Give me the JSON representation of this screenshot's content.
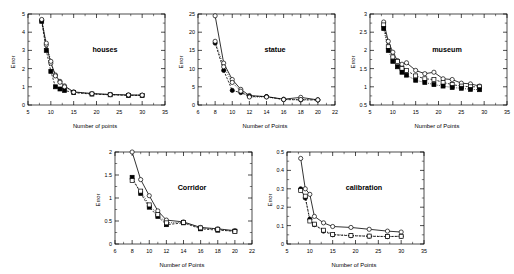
{
  "figure": {
    "background": "#ffffff",
    "panel_count": 5
  },
  "chart_data": [
    {
      "id": "houses",
      "type": "line",
      "title": "houses",
      "xlabel": "Number of points",
      "ylabel": "Error",
      "xlim": [
        5,
        35
      ],
      "ylim": [
        0,
        5
      ],
      "xticks": [
        5,
        10,
        15,
        20,
        25,
        30,
        35
      ],
      "yticks": [
        0,
        1,
        2,
        3,
        4,
        5
      ],
      "grid": false,
      "legend": "none",
      "series": [
        {
          "name": "solid-open-circle",
          "style": "solid",
          "marker": "open-circle",
          "x": [
            8,
            9,
            10,
            11,
            12,
            13,
            15,
            19,
            23,
            27,
            30
          ],
          "y": [
            4.65,
            3.3,
            2.3,
            1.65,
            1.3,
            1.05,
            0.72,
            0.63,
            0.58,
            0.55,
            0.54
          ]
        },
        {
          "name": "dashed-filled-square",
          "style": "dashed",
          "marker": "filled-square",
          "x": [
            8,
            9,
            10,
            11,
            12,
            13,
            15,
            19,
            23,
            27,
            30
          ],
          "y": [
            4.6,
            3.0,
            1.85,
            1.0,
            0.88,
            0.8,
            0.68,
            0.6,
            0.56,
            0.53,
            0.53
          ]
        },
        {
          "name": "dotted-open-circle",
          "style": "dotted",
          "marker": "open-circle",
          "x": [
            8,
            9,
            10,
            11,
            12,
            13,
            15,
            19,
            23,
            27,
            30
          ],
          "y": [
            4.7,
            3.4,
            2.4,
            1.6,
            1.25,
            1.0,
            0.7,
            0.62,
            0.57,
            0.55,
            0.54
          ]
        }
      ]
    },
    {
      "id": "statue",
      "type": "line",
      "title": "statue",
      "xlabel": "Number of Points",
      "ylabel": "Error",
      "xlim": [
        6,
        22
      ],
      "ylim": [
        0,
        25
      ],
      "xticks": [
        6,
        8,
        10,
        12,
        14,
        16,
        18,
        20,
        22
      ],
      "yticks": [
        0,
        5,
        10,
        15,
        20,
        25
      ],
      "grid": false,
      "legend": "none",
      "series": [
        {
          "name": "solid-open-circle",
          "style": "solid",
          "marker": "open-circle",
          "x": [
            8,
            9,
            10,
            11,
            12,
            14,
            16,
            18,
            20
          ],
          "y": [
            24.5,
            11.5,
            7.0,
            4.3,
            2.6,
            2.3,
            1.6,
            2.1,
            1.4
          ]
        },
        {
          "name": "dashed-filled-circle",
          "style": "dashed",
          "marker": "filled-circle",
          "x": [
            8,
            9,
            10,
            11,
            12,
            14,
            16,
            18,
            20
          ],
          "y": [
            17.0,
            9.5,
            4.0,
            3.4,
            2.4,
            2.3,
            1.5,
            1.4,
            1.4
          ]
        },
        {
          "name": "dotted-open-circle",
          "style": "dotted",
          "marker": "open-circle",
          "x": [
            8,
            9,
            10,
            11,
            12,
            14,
            16,
            18,
            20
          ],
          "y": [
            17.5,
            10.5,
            6.2,
            3.8,
            2.2,
            2.2,
            1.5,
            1.5,
            1.4
          ]
        }
      ]
    },
    {
      "id": "museum",
      "type": "line",
      "title": "museum",
      "xlabel": "Number of Points",
      "ylabel": "Error",
      "xlim": [
        5,
        35
      ],
      "ylim": [
        0.5,
        3
      ],
      "xticks": [
        5,
        10,
        15,
        20,
        25,
        30,
        35
      ],
      "yticks": [
        0.5,
        1,
        1.5,
        2,
        2.5,
        3
      ],
      "grid": false,
      "legend": "none",
      "series": [
        {
          "name": "solid-open-circle",
          "style": "solid",
          "marker": "open-circle",
          "x": [
            8,
            9,
            10,
            11,
            12,
            13,
            15,
            17,
            19,
            21,
            23,
            25,
            27,
            29
          ],
          "y": [
            2.78,
            2.25,
            1.95,
            1.72,
            1.62,
            1.66,
            1.45,
            1.36,
            1.4,
            1.22,
            1.2,
            1.1,
            1.08,
            1.02
          ]
        },
        {
          "name": "dashed-open-square",
          "style": "dashed",
          "marker": "open-square",
          "x": [
            8,
            9,
            10,
            11,
            12,
            13,
            15,
            17,
            19,
            21,
            23,
            25,
            27,
            29
          ],
          "y": [
            2.7,
            2.1,
            1.82,
            1.7,
            1.5,
            1.45,
            1.3,
            1.22,
            1.2,
            1.12,
            1.06,
            1.02,
            1.0,
            1.0
          ]
        },
        {
          "name": "dotted-filled-square",
          "style": "dotted",
          "marker": "filled-square",
          "x": [
            8,
            9,
            10,
            11,
            12,
            13,
            15,
            17,
            19,
            21,
            23,
            25,
            27,
            29
          ],
          "y": [
            2.6,
            2.0,
            1.7,
            1.55,
            1.4,
            1.32,
            1.18,
            1.12,
            1.06,
            1.02,
            0.98,
            0.96,
            0.93,
            0.92
          ]
        }
      ]
    },
    {
      "id": "corridor",
      "type": "line",
      "title": "Corridor",
      "xlabel": "Number of Points",
      "ylabel": "Error",
      "xlim": [
        6,
        22
      ],
      "ylim": [
        0,
        2
      ],
      "xticks": [
        6,
        8,
        10,
        12,
        14,
        16,
        18,
        20,
        22
      ],
      "yticks": [
        0,
        0.5,
        1,
        1.5,
        2
      ],
      "grid": false,
      "legend": "none",
      "series": [
        {
          "name": "solid-open-circle",
          "style": "solid",
          "marker": "open-circle",
          "x": [
            8,
            9,
            10,
            11,
            12,
            14,
            16,
            18,
            20
          ],
          "y": [
            2.0,
            1.4,
            1.05,
            0.72,
            0.52,
            0.48,
            0.36,
            0.33,
            0.29
          ]
        },
        {
          "name": "dashed-filled-square",
          "style": "dashed",
          "marker": "filled-square",
          "x": [
            8,
            9,
            10,
            11,
            12,
            14,
            16,
            18,
            20
          ],
          "y": [
            1.45,
            1.1,
            0.8,
            0.6,
            0.42,
            0.46,
            0.33,
            0.3,
            0.28
          ]
        },
        {
          "name": "dotted-open-square",
          "style": "dotted",
          "marker": "open-square",
          "x": [
            8,
            9,
            10,
            11,
            12,
            14,
            16,
            18,
            20
          ],
          "y": [
            1.38,
            1.15,
            0.85,
            0.64,
            0.46,
            0.47,
            0.35,
            0.32,
            0.27
          ]
        }
      ]
    },
    {
      "id": "calibration",
      "type": "line",
      "title": "calibration",
      "xlabel": "Number of Points",
      "ylabel": "Error",
      "xlim": [
        5,
        35
      ],
      "ylim": [
        0,
        0.5
      ],
      "xticks": [
        5,
        10,
        15,
        20,
        25,
        30,
        35
      ],
      "yticks": [
        0,
        0.1,
        0.2,
        0.3,
        0.4,
        0.5
      ],
      "grid": false,
      "legend": "none",
      "series": [
        {
          "name": "solid-open-circle",
          "style": "solid",
          "marker": "open-circle",
          "x": [
            8,
            9,
            10,
            11,
            13,
            15,
            19,
            23,
            27,
            30
          ],
          "y": [
            0.465,
            0.3,
            0.27,
            0.15,
            0.115,
            0.095,
            0.09,
            0.08,
            0.07,
            0.065
          ]
        },
        {
          "name": "dashed-filled-circle",
          "style": "dashed",
          "marker": "filled-circle",
          "x": [
            8,
            9,
            10,
            11,
            13,
            15,
            19,
            23,
            27,
            30
          ],
          "y": [
            0.3,
            0.25,
            0.135,
            0.105,
            0.07,
            0.05,
            0.045,
            0.042,
            0.04,
            0.042
          ]
        },
        {
          "name": "dotted-open-square",
          "style": "dotted",
          "marker": "open-square",
          "x": [
            8,
            9,
            10,
            11,
            13,
            15,
            19,
            23,
            27,
            30
          ],
          "y": [
            0.29,
            0.26,
            0.125,
            0.108,
            0.075,
            0.052,
            0.046,
            0.043,
            0.041,
            0.042
          ]
        }
      ]
    }
  ],
  "panels": {
    "houses": {
      "title": "houses",
      "xlabel": "Number of points",
      "ylabel": "Error",
      "xticks": [
        "5",
        "10",
        "15",
        "20",
        "25",
        "30",
        "35"
      ],
      "yticks": [
        "0",
        "1",
        "2",
        "3",
        "4",
        "5"
      ]
    },
    "statue": {
      "title": "statue",
      "xlabel": "Number of Points",
      "ylabel": "Error",
      "xticks": [
        "6",
        "8",
        "10",
        "12",
        "14",
        "16",
        "18",
        "20",
        "22"
      ],
      "yticks": [
        "0",
        "5",
        "10",
        "15",
        "20",
        "25"
      ]
    },
    "museum": {
      "title": "museum",
      "xlabel": "Number of Points",
      "ylabel": "Error",
      "xticks": [
        "5",
        "10",
        "15",
        "20",
        "25",
        "30",
        "35"
      ],
      "yticks": [
        "0.5",
        "1",
        "1.5",
        "2",
        "2.5",
        "3"
      ]
    },
    "corridor": {
      "title": "Corridor",
      "xlabel": "Number of Points",
      "ylabel": "Error",
      "xticks": [
        "6",
        "8",
        "10",
        "12",
        "14",
        "16",
        "18",
        "20",
        "22"
      ],
      "yticks": [
        "0",
        "0.5",
        "1",
        "1.5",
        "2"
      ]
    },
    "calibration": {
      "title": "calibration",
      "xlabel": "Number of Points",
      "ylabel": "Error",
      "xticks": [
        "5",
        "10",
        "15",
        "20",
        "25",
        "30",
        "35"
      ],
      "yticks": [
        "0",
        "0.1",
        "0.2",
        "0.3",
        "0.4",
        "0.5"
      ]
    }
  }
}
